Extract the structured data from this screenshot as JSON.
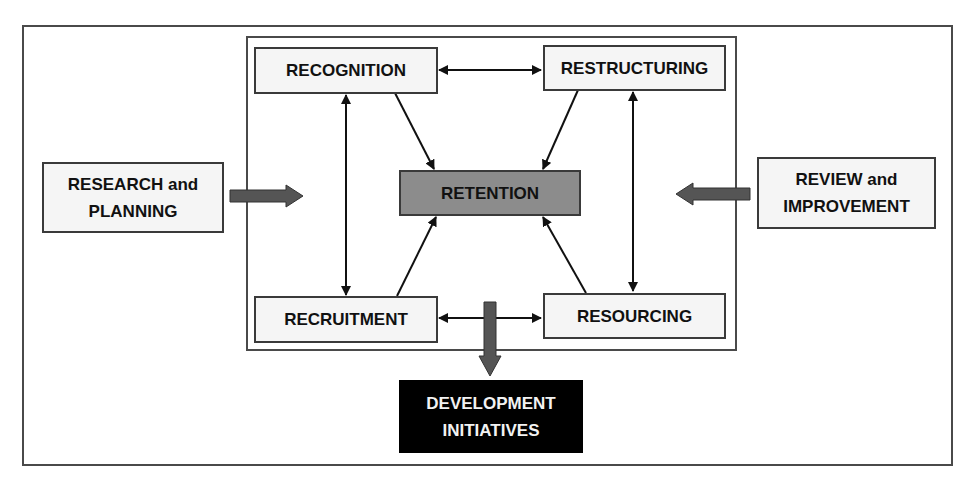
{
  "diagram": {
    "nodes": {
      "recognition": {
        "label": "RECOGNITION"
      },
      "restructuring": {
        "label": "RESTRUCTURING"
      },
      "retention": {
        "label": "RETENTION"
      },
      "recruitment": {
        "label": "RECRUITMENT"
      },
      "resourcing": {
        "label": "RESOURCING"
      },
      "research_planning": {
        "line1": "RESEARCH and",
        "line2": "PLANNING"
      },
      "review_improvement": {
        "line1": "REVIEW and",
        "line2": "IMPROVEMENT"
      },
      "development_initiatives": {
        "line1": "DEVELOPMENT",
        "line2": "INITIATIVES"
      }
    },
    "edges": [
      {
        "from": "RECOGNITION",
        "to": "RESTRUCTURING",
        "type": "bidirectional"
      },
      {
        "from": "RECRUITMENT",
        "to": "RESOURCING",
        "type": "bidirectional"
      },
      {
        "from": "RECOGNITION",
        "to": "RECRUITMENT",
        "type": "bidirectional"
      },
      {
        "from": "RESTRUCTURING",
        "to": "RESOURCING",
        "type": "bidirectional"
      },
      {
        "from": "RECOGNITION",
        "to": "RETENTION",
        "type": "directed"
      },
      {
        "from": "RESTRUCTURING",
        "to": "RETENTION",
        "type": "directed"
      },
      {
        "from": "RECRUITMENT",
        "to": "RETENTION",
        "type": "directed"
      },
      {
        "from": "RESOURCING",
        "to": "RETENTION",
        "type": "directed"
      },
      {
        "from": "RESEARCH and PLANNING",
        "to": "core",
        "type": "block-arrow"
      },
      {
        "from": "REVIEW and IMPROVEMENT",
        "to": "core",
        "type": "block-arrow"
      },
      {
        "from": "core",
        "to": "DEVELOPMENT INITIATIVES",
        "type": "block-arrow"
      }
    ],
    "colors": {
      "box_fill": "#f5f5f5",
      "retention_fill": "#8c8c8c",
      "development_fill": "#000000",
      "block_arrow": "#555555",
      "line": "#111111"
    }
  }
}
